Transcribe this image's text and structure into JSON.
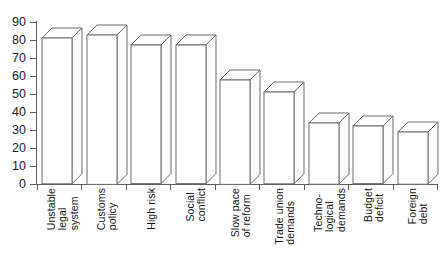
{
  "chart_data": {
    "type": "bar",
    "title": "",
    "subtitle": "",
    "xlabel": "",
    "ylabel": "",
    "ylim": [
      0,
      90
    ],
    "ytick_step": 10,
    "yticks": [
      0,
      10,
      20,
      30,
      40,
      50,
      60,
      70,
      80,
      90
    ],
    "ytick_labels": [
      "0",
      "10",
      "20",
      "30",
      "40",
      "50",
      "60",
      "70",
      "80",
      "90"
    ],
    "grid": false,
    "legend": false,
    "legend_position": "none",
    "bar_style": "3d-outline",
    "categories": [
      "Unstable legal system",
      "Customs policy",
      "High risk",
      "Social conflict",
      "Slow pace of reform",
      "Trade union demands",
      "Techno-logical demands",
      "Budget deficit",
      "Foreign debt"
    ],
    "category_lines": [
      [
        "Unstable",
        "legal",
        "system"
      ],
      [
        "Customs",
        "policy"
      ],
      [
        "High risk"
      ],
      [
        "Social",
        "conflict"
      ],
      [
        "Slow pace",
        "of reform"
      ],
      [
        "Trade union",
        "demands"
      ],
      [
        "Techno-",
        "logical",
        "demands"
      ],
      [
        "Budget",
        "deficit"
      ],
      [
        "Foreign",
        "debt"
      ]
    ],
    "values": [
      81,
      83,
      77,
      77,
      58,
      51,
      34,
      32,
      29
    ],
    "series": [
      {
        "name": "",
        "values": [
          81,
          83,
          77,
          77,
          58,
          51,
          34,
          32,
          29
        ]
      }
    ],
    "annotations": []
  },
  "colors": {
    "background": "#ffffff",
    "axis": "#5d5d5d",
    "bar_stroke": "#6a6a6a",
    "bar_fill": "#ffffff",
    "text": "#141414"
  }
}
